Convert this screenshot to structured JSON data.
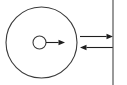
{
  "figure": {
    "type": "physics-free-body-diagram",
    "width": 127,
    "height": 85,
    "background_color": "#ffffff",
    "title": "",
    "caption": "",
    "labels": [],
    "colors": {
      "outline": "#3a3a3a",
      "arrow": "#1f1f1f",
      "wall": "#555555",
      "fill": "#ffffff"
    }
  },
  "elements": {
    "disc": {
      "name": "large circle",
      "center_x": 41.5,
      "center_y": 42.5,
      "radius": 35.5,
      "fill": "none",
      "stroke_width": 1.1,
      "label": ""
    },
    "hub": {
      "name": "small inner circle",
      "center_x": 39.5,
      "center_y": 42.5,
      "radius": 6.5,
      "fill": "#ffffff",
      "stroke_width": 1.1,
      "label": ""
    },
    "wall": {
      "name": "vertical line",
      "x": 113,
      "y_start": 0,
      "y_end": 85,
      "stroke_width": 1.2,
      "label": ""
    },
    "arrows": [
      {
        "name": "radius-arrow",
        "direction": "right",
        "x_start": 46,
        "x_end": 65,
        "y": 42.5,
        "head_at": "end",
        "label": ""
      },
      {
        "name": "upper-force-arrow",
        "direction": "right",
        "x_start": 80,
        "x_end": 113,
        "y": 36.5,
        "head_at": "end",
        "label": ""
      },
      {
        "name": "lower-force-arrow",
        "direction": "left",
        "x_start": 113,
        "x_end": 80,
        "y": 47.5,
        "head_at": "end",
        "label": ""
      }
    ]
  }
}
